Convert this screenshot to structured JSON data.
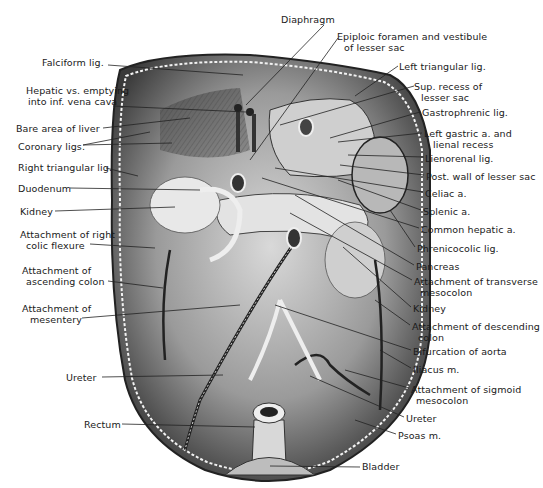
{
  "figure": {
    "labels_left": [
      {
        "id": "falciform",
        "text": "Falciform lig.",
        "x": 42,
        "y": 62
      },
      {
        "id": "hepatic_vs_1",
        "text": "Hepatic vs. emptying",
        "x": 26,
        "y": 90
      },
      {
        "id": "hepatic_vs_2",
        "text": "into inf. vena cava",
        "x": 28,
        "y": 101
      },
      {
        "id": "bare_area",
        "text": "Bare area of liver",
        "x": 16,
        "y": 123
      },
      {
        "id": "coronary",
        "text": "Coronary ligs.",
        "x": 18,
        "y": 141
      },
      {
        "id": "right_triangular",
        "text": "Right triangular lig.",
        "x": 18,
        "y": 162
      },
      {
        "id": "duodenum",
        "text": "Duodenum",
        "x": 18,
        "y": 183
      },
      {
        "id": "kidney_r",
        "text": "Kidney",
        "x": 20,
        "y": 206
      },
      {
        "id": "att_right_colic_1",
        "text": "Attachment of right",
        "x": 20,
        "y": 229
      },
      {
        "id": "att_right_colic_2",
        "text": "colic  flexure",
        "x": 26,
        "y": 240
      },
      {
        "id": "att_asc_colon_1",
        "text": "Attachment  of",
        "x": 22,
        "y": 265
      },
      {
        "id": "att_asc_colon_2",
        "text": "ascending  colon",
        "x": 26,
        "y": 276
      },
      {
        "id": "att_mesentery_1",
        "text": "Attachment of",
        "x": 22,
        "y": 303
      },
      {
        "id": "att_mesentery_2",
        "text": "mesentery",
        "x": 30,
        "y": 314
      },
      {
        "id": "ureter_l",
        "text": "Ureter",
        "x": 66,
        "y": 372
      },
      {
        "id": "rectum",
        "text": "Rectum",
        "x": 84,
        "y": 419
      }
    ],
    "labels_right": [
      {
        "id": "diaphragm",
        "text": "Diaphragm",
        "x": 281,
        "y": 14
      },
      {
        "id": "epiploic_1",
        "text": "Epiploic foramen  and  vestibule",
        "x": 337,
        "y": 31
      },
      {
        "id": "epiploic_2",
        "text": "of  lesser  sac",
        "x": 344,
        "y": 42
      },
      {
        "id": "left_triangular",
        "text": "Left  triangular  lig.",
        "x": 399,
        "y": 61
      },
      {
        "id": "sup_recess_1",
        "text": "Sup. recess of",
        "x": 414,
        "y": 81
      },
      {
        "id": "sup_recess_2",
        "text": "lesser  sac",
        "x": 421,
        "y": 92
      },
      {
        "id": "gastrophrenic",
        "text": "Gastrophrenic lig.",
        "x": 422,
        "y": 107
      },
      {
        "id": "left_gastric_1",
        "text": "Left gastric a. and",
        "x": 424,
        "y": 128
      },
      {
        "id": "left_gastric_2",
        "text": "lienal recess",
        "x": 433,
        "y": 139
      },
      {
        "id": "lienorenal",
        "text": "Lienorenal lig.",
        "x": 425,
        "y": 153
      },
      {
        "id": "post_wall",
        "text": "Post. wall of  lesser  sac",
        "x": 426,
        "y": 171
      },
      {
        "id": "celiac",
        "text": "Celiac a.",
        "x": 425,
        "y": 188
      },
      {
        "id": "splenic",
        "text": "Splenic  a.",
        "x": 423,
        "y": 206
      },
      {
        "id": "common_hepatic",
        "text": "Common  hepatic  a.",
        "x": 421,
        "y": 224
      },
      {
        "id": "phrenicocolic",
        "text": "Phrenicocolic  lig.",
        "x": 417,
        "y": 243
      },
      {
        "id": "pancreas",
        "text": "Pancreas",
        "x": 416,
        "y": 261
      },
      {
        "id": "att_transverse_1",
        "text": "Attachment of transverse",
        "x": 414,
        "y": 276
      },
      {
        "id": "att_transverse_2",
        "text": "mesocolon",
        "x": 420,
        "y": 287
      },
      {
        "id": "kidney_l",
        "text": "Kidney",
        "x": 413,
        "y": 303
      },
      {
        "id": "att_descending_1",
        "text": "Attachment of  descending",
        "x": 412,
        "y": 321
      },
      {
        "id": "att_descending_2",
        "text": "colon",
        "x": 418,
        "y": 332
      },
      {
        "id": "bifurcation",
        "text": "Bifurcation of aorta",
        "x": 413,
        "y": 346
      },
      {
        "id": "iliacus",
        "text": "Iliacus  m.",
        "x": 413,
        "y": 364
      },
      {
        "id": "att_sigmoid_1",
        "text": "Attachment of  sigmoid",
        "x": 411,
        "y": 384
      },
      {
        "id": "att_sigmoid_2",
        "text": "mesocolon",
        "x": 416,
        "y": 395
      },
      {
        "id": "ureter_r",
        "text": "Ureter",
        "x": 406,
        "y": 413
      },
      {
        "id": "psoas",
        "text": "Psoas  m.",
        "x": 398,
        "y": 430
      },
      {
        "id": "bladder",
        "text": "Bladder",
        "x": 362,
        "y": 463
      }
    ]
  }
}
